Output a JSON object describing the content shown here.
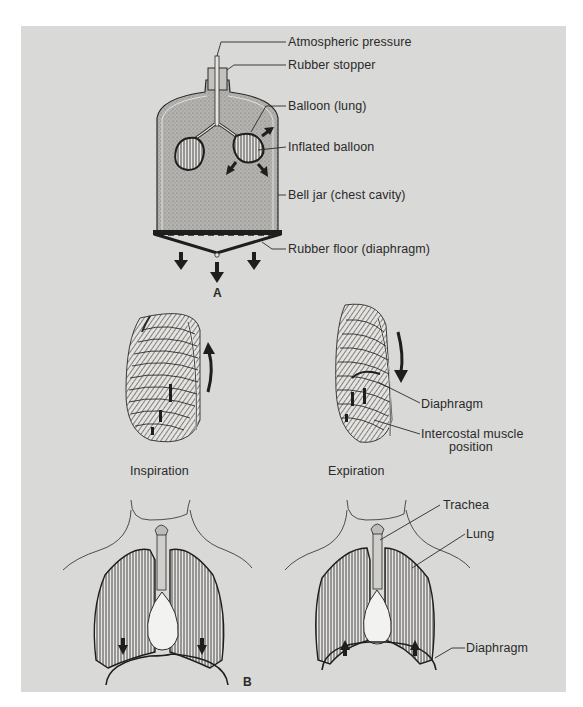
{
  "figure": {
    "part_a": {
      "caption": "A",
      "labels": {
        "atmospheric_pressure": "Atmospheric pressure",
        "rubber_stopper": "Rubber stopper",
        "balloon_lung": "Balloon (lung)",
        "inflated_balloon": "Inflated balloon",
        "bell_jar": "Bell jar (chest cavity)",
        "rubber_floor": "Rubber floor (diaphragm)"
      }
    },
    "part_b": {
      "caption": "B",
      "ribcage_labels": {
        "diaphragm": "Diaphragm",
        "intercostal_line1": "Intercostal muscle",
        "intercostal_line2": "position"
      },
      "phases": {
        "inspiration": "Inspiration",
        "expiration": "Expiration"
      },
      "thorax_labels": {
        "trachea": "Trachea",
        "lung": "Lung",
        "diaphragm": "Diaphragm"
      }
    },
    "colors": {
      "panel_bg": "#d9d9d7",
      "ink": "#1e1e1e",
      "stipple": "#a9a8a4"
    }
  }
}
